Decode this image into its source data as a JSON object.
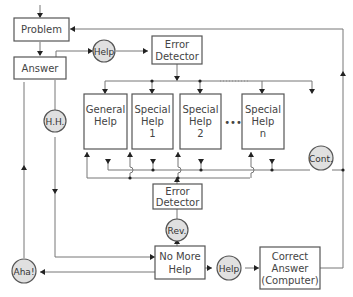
{
  "diagram": {
    "nodes": {
      "problem": {
        "label": "Problem"
      },
      "answer": {
        "label": "Answer"
      },
      "help_top": {
        "label": "Help"
      },
      "error_detector_top": {
        "line1": "Error",
        "line2": "Detector"
      },
      "general_help": {
        "line1": "General",
        "line2": "Help"
      },
      "special_help_1": {
        "line1": "Special",
        "line2": "Help",
        "line3": "1"
      },
      "special_help_2": {
        "line1": "Special",
        "line2": "Help",
        "line3": "2"
      },
      "ellipsis": {
        "label": "•••"
      },
      "special_help_n": {
        "line1": "Special",
        "line2": "Help",
        "line3": "n"
      },
      "hh": {
        "label": "H.H."
      },
      "cont": {
        "label": "Cont."
      },
      "error_detector_bottom": {
        "line1": "Error",
        "line2": "Detector"
      },
      "rev": {
        "label": "Rev."
      },
      "no_more_help": {
        "line1": "No  More",
        "line2": "Help"
      },
      "help_bottom": {
        "label": "Help"
      },
      "correct_answer": {
        "line1": "Correct",
        "line2": "Answer",
        "line3": "(Computer)"
      },
      "aha": {
        "label": "Aha!"
      }
    },
    "colors": {
      "circle_fill": "#e0e0e0",
      "stroke": "#555555",
      "arrow": "#222222"
    }
  }
}
